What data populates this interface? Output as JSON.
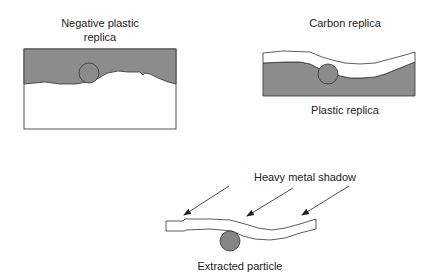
{
  "panels": {
    "negative": {
      "label_line1": "Negative plastic",
      "label_line2": "replica"
    },
    "positive": {
      "top_label": "Carbon replica",
      "bottom_label": "Plastic replica"
    },
    "extraction": {
      "top_label": "Heavy metal shadow",
      "bottom_label": "Extracted particle"
    }
  },
  "colors": {
    "fill_gray": "#8c8c8c",
    "stroke": "#333333",
    "particle": "#858585",
    "background": "#ffffff"
  }
}
